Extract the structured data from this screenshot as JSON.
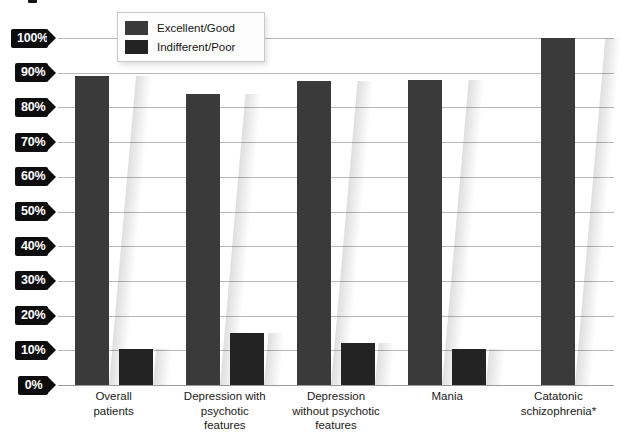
{
  "chart_data": {
    "type": "bar",
    "title": "",
    "xlabel": "",
    "ylabel": "",
    "ylim": [
      0,
      100
    ],
    "grid": true,
    "legend_position": "top-center",
    "categories": [
      "Overall patients",
      "Depression with psychotic features",
      "Depression without psychotic features",
      "Mania",
      "Catatonic schizophrenia*"
    ],
    "category_lines": [
      [
        "Overall",
        "patients"
      ],
      [
        "Depression with",
        "psychotic",
        "features"
      ],
      [
        "Depression",
        "without psychotic",
        "features"
      ],
      [
        "Mania"
      ],
      [
        "Catatonic",
        "schizophrenia*"
      ]
    ],
    "series": [
      {
        "name": "Excellent/Good",
        "color": "#3a3a3a",
        "values": [
          89,
          84,
          87.5,
          88,
          100
        ]
      },
      {
        "name": "Indifferent/Poor",
        "color": "#232323",
        "values": [
          10.5,
          15,
          12,
          10.5,
          null
        ]
      }
    ],
    "ytick_labels": [
      "100%",
      "90%",
      "80%",
      "70%",
      "60%",
      "50%",
      "40%",
      "30%",
      "20%",
      "10%",
      "0%"
    ],
    "ytick_values": [
      100,
      90,
      80,
      70,
      60,
      50,
      40,
      30,
      20,
      10,
      0
    ]
  },
  "legend": {
    "items": [
      {
        "label": "Excellent/Good",
        "color": "#3a3a3a"
      },
      {
        "label": "Indifferent/Poor",
        "color": "#232323"
      }
    ]
  },
  "colors": {
    "excellent_good": "#3a3a3a",
    "indifferent_poor": "#232323",
    "gridline": "#b9b9b9",
    "axis_tag_bg": "#0d0d0d",
    "axis_tag_text": "#ffffff",
    "background": "#ffffff"
  }
}
